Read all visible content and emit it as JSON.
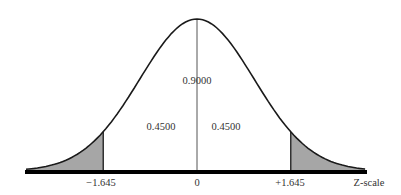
{
  "chart_data": {
    "type": "area",
    "title": "",
    "xlabel": "Z-scale",
    "ylabel": "",
    "distribution": "standard normal",
    "x_ticks": [
      {
        "value": -1.645,
        "label": "−1.645"
      },
      {
        "value": 0,
        "label": "0"
      },
      {
        "value": 1.645,
        "label": "+1.645"
      }
    ],
    "xlim": [
      -3.0,
      2.95
    ],
    "regions": [
      {
        "name": "left-tail",
        "from": -3.0,
        "to": -1.645,
        "shaded": true,
        "area": 0.05
      },
      {
        "name": "left-center",
        "from": -1.645,
        "to": 0,
        "shaded": false,
        "area": 0.45,
        "label": "0.4500"
      },
      {
        "name": "right-center",
        "from": 0,
        "to": 1.645,
        "shaded": false,
        "area": 0.45,
        "label": "0.4500"
      },
      {
        "name": "right-tail",
        "from": 1.645,
        "to": 2.95,
        "shaded": true,
        "area": 0.05
      }
    ],
    "annotations": [
      {
        "text": "0.9000",
        "meaning": "area between -1.645 and +1.645"
      },
      {
        "text": "0.4500",
        "position": "left of mean"
      },
      {
        "text": "0.4500",
        "position": "right of mean"
      }
    ],
    "grid": false,
    "legend": null
  },
  "labels": {
    "center_area": "0.9000",
    "left_area": "0.4500",
    "right_area": "0.4500",
    "tick_neg": "−1.645",
    "tick_zero": "0",
    "tick_pos": "+1.645",
    "axis_name": "Z-scale"
  },
  "colors": {
    "curve": "#1a1a1a",
    "tail_fill": "#a6a6a6",
    "axis": "#000000",
    "center_line": "#555555",
    "text": "#333333"
  }
}
